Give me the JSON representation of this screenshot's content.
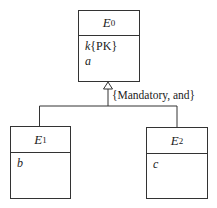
{
  "diagram": {
    "type": "uml-generalization",
    "superclass": {
      "name": "E",
      "subscript": "0",
      "attributes": [
        {
          "name": "k",
          "tag": "{PK}"
        },
        {
          "name": "a",
          "tag": ""
        }
      ]
    },
    "subclasses": [
      {
        "name": "E",
        "subscript": "1",
        "attributes": [
          {
            "name": "b",
            "tag": ""
          }
        ]
      },
      {
        "name": "E",
        "subscript": "2",
        "attributes": [
          {
            "name": "c",
            "tag": ""
          }
        ]
      }
    ],
    "constraint": "{Mandatory, and}",
    "colors": {
      "line": "#333333",
      "background": "#ffffff",
      "text": "#222222"
    }
  }
}
